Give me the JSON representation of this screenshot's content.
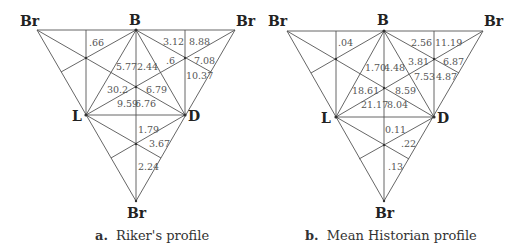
{
  "panels": [
    {
      "id": "a",
      "caption_prefix": "a.",
      "caption": "Riker's profile",
      "vertices": {
        "br_top_left": "Br",
        "b": "B",
        "br_top_right": "Br",
        "l": "L",
        "d": "D",
        "br_bottom": "Br"
      },
      "values": {
        "v_top_left": ".66",
        "v_b_right_upper": "3.12",
        "v_top_right": "8.88",
        "v_b_l_left": "5.77",
        "v_b_l_right": "2.44",
        "v_right_mid": ".6",
        "v_right_outer": "7.08",
        "v_right_lower": "10.37",
        "v_center_left": "30.2",
        "v_center_right": "6.79",
        "v_ld_left": "9.59",
        "v_ld_right": "6.76",
        "v_bottom_upper": "1.79",
        "v_bottom_right": "3.67",
        "v_bottom_lower": "2.24"
      }
    },
    {
      "id": "b",
      "caption_prefix": "b.",
      "caption": "Mean Historian profile",
      "vertices": {
        "br_top_left": "Br",
        "b": "B",
        "br_top_right": "Br",
        "l": "L",
        "d": "D",
        "br_bottom": "Br"
      },
      "values": {
        "v_top_left": ".04",
        "v_b_right_upper": "2.56",
        "v_top_right": "11.19",
        "v_b_l_left": "1.70",
        "v_b_l_right": "4.48",
        "v_right_mid": "3.81",
        "v_right_outer": "6.87",
        "v_right_lower": "4.87",
        "v_right_inner": "7.53",
        "v_center_left": "18.61",
        "v_center_right": "8.59",
        "v_ld_left": "21.17",
        "v_ld_right": "8.04",
        "v_bottom_upper": "0.11",
        "v_bottom_right": ".22",
        "v_bottom_lower": ".13"
      }
    }
  ]
}
